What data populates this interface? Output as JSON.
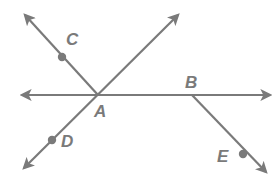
{
  "diagram": {
    "color": "#7a7a7a",
    "intersection": {
      "label": "A",
      "x": 98,
      "y": 95
    },
    "lines": [
      {
        "id": "horizontal-line",
        "x1": 22,
        "y1": 95,
        "x2": 270,
        "y2": 95,
        "arrow_start": true,
        "arrow_end": true
      },
      {
        "id": "line-CA",
        "x1": 25,
        "y1": 15,
        "x2": 98,
        "y2": 95,
        "arrow_start": true,
        "arrow_end": false
      },
      {
        "id": "line-DA",
        "x1": 24,
        "y1": 168,
        "x2": 178,
        "y2": 15,
        "arrow_start": true,
        "arrow_end": true
      },
      {
        "id": "ray-BE",
        "x1": 192,
        "y1": 95,
        "x2": 266,
        "y2": 172,
        "arrow_start": false,
        "arrow_end": true
      }
    ],
    "points": [
      {
        "label": "A",
        "x": 98,
        "y": 95,
        "dot": false,
        "label_x": 94,
        "label_y": 117
      },
      {
        "label": "B",
        "x": 192,
        "y": 95,
        "dot": false,
        "label_x": 185,
        "label_y": 88
      },
      {
        "label": "C",
        "x": 62,
        "y": 57,
        "dot": true,
        "label_x": 66,
        "label_y": 45
      },
      {
        "label": "D",
        "x": 52,
        "y": 140,
        "dot": true,
        "label_x": 61,
        "label_y": 147
      },
      {
        "label": "E",
        "x": 243,
        "y": 154,
        "dot": true,
        "label_x": 217,
        "label_y": 162
      }
    ]
  }
}
